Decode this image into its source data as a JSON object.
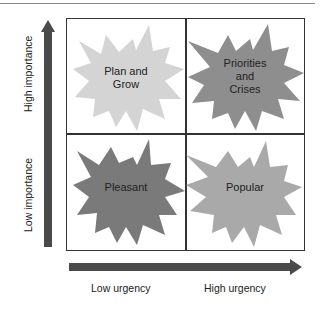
{
  "diagram": {
    "type": "2x2 matrix",
    "axes": {
      "y": {
        "low_label": "Low importance",
        "high_label": "High importance",
        "arrow_direction": "up"
      },
      "x": {
        "low_label": "Low urgency",
        "high_label": "High urgency",
        "arrow_direction": "right"
      }
    },
    "quadrants": [
      {
        "position": "top-left",
        "lines": [
          "Plan and",
          "Grow"
        ],
        "color": "#d4d4d4"
      },
      {
        "position": "top-right",
        "lines": [
          "Priorities",
          "and",
          "Crises"
        ],
        "color": "#8e8e8e"
      },
      {
        "position": "bottom-left",
        "lines": [
          "Pleasant"
        ],
        "color": "#7a7a7a"
      },
      {
        "position": "bottom-right",
        "lines": [
          "Popular"
        ],
        "color": "#a9a9a9"
      }
    ],
    "colors": {
      "arrow": "#4a4a4a",
      "grid_line": "#333333",
      "text": "#222222"
    }
  }
}
